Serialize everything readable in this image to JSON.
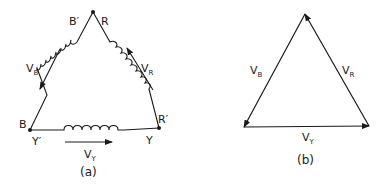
{
  "figure_a": {
    "caption": "(a)",
    "nodes": {
      "top_left": "B′",
      "top_right": "R",
      "left_upper": "B",
      "left_lower": "Y′",
      "right_upper": "R′",
      "right_lower": "Y"
    },
    "voltages": {
      "left": {
        "main": "V",
        "sub": "B"
      },
      "right": {
        "main": "V",
        "sub": "R"
      },
      "bottom": {
        "main": "V",
        "sub": "Y"
      }
    }
  },
  "figure_b": {
    "caption": "(b)",
    "voltages": {
      "left": {
        "main": "V",
        "sub": "B"
      },
      "right": {
        "main": "V",
        "sub": "R"
      },
      "bottom": {
        "main": "V",
        "sub": "Y"
      }
    }
  },
  "colors": {
    "ink": "#1a1a1a",
    "background": "#ffffff"
  }
}
